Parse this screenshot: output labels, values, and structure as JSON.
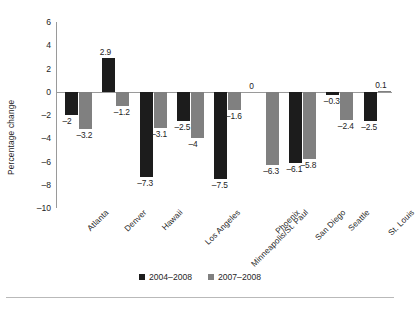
{
  "chart_data": {
    "type": "bar",
    "title": "",
    "xlabel": "",
    "ylabel": "Percentage change",
    "ylim": [
      -10,
      6
    ],
    "yticks": [
      6,
      4,
      2,
      0,
      -2,
      -4,
      -6,
      -8,
      -10
    ],
    "ytick_labels": [
      "6",
      "4",
      "2",
      "0",
      "–2",
      "–4",
      "–6",
      "–8",
      "–10"
    ],
    "grid": false,
    "legend_position": "bottom",
    "categories": [
      "Atlanta",
      "Denver",
      "Hawaii",
      "Los Angeles",
      "Minneapolis/St. Paul",
      "Phoenix",
      "San Diego",
      "Seattle",
      "St. Louis"
    ],
    "series": [
      {
        "name": "2004–2008",
        "color": "#1c1c1c",
        "values": [
          -2,
          2.9,
          -7.3,
          -2.5,
          -7.5,
          0,
          -6.1,
          -0.3,
          -2.5
        ],
        "value_labels": [
          "–2",
          "2.9",
          "–7.3",
          "–2.5",
          "–7.5",
          "0",
          "–6.1",
          "–0.3",
          "–2.5"
        ]
      },
      {
        "name": "2007–2008",
        "color": "#808080",
        "values": [
          -3.2,
          -1.2,
          -3.1,
          -4,
          -1.6,
          -6.3,
          -5.8,
          -2.4,
          0.1
        ],
        "value_labels": [
          "–3.2",
          "–1.2",
          "–3.1",
          "–4",
          "–1.6",
          "–6.3",
          "–5.8",
          "–2.4",
          "0.1"
        ]
      }
    ]
  },
  "legend": {
    "items": [
      {
        "label": "2004–2008",
        "color": "#1c1c1c"
      },
      {
        "label": "2007–2008",
        "color": "#808080"
      }
    ]
  }
}
